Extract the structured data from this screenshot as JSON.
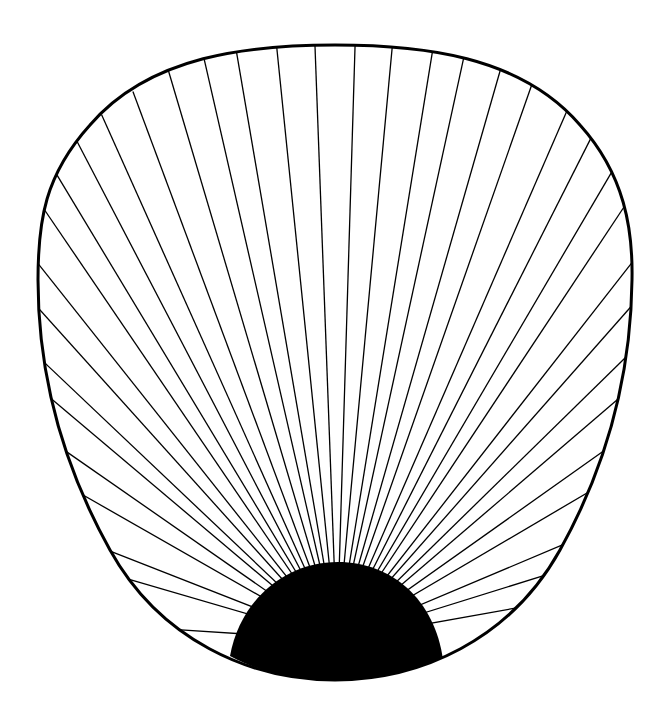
{
  "figure": {
    "background": "#ffffff",
    "stroke_color": "#000000",
    "hub_color": "#000000",
    "focus": [
      337,
      640
    ],
    "outline_path": "M 335 45 C 420 45, 520 55, 580 125 C 625 175, 633 230, 632 280 C 631 370, 610 460, 560 550 C 510 640, 420 680, 335 680 C 250 680, 160 640, 110 550 C 60 460, 38 370, 38 280 C 38 220, 45 175, 90 125 C 150 55, 250 45, 335 45 Z",
    "hub_path": "M 230 656 C 240 600, 285 562, 338 562 C 392 562, 435 600, 443 660 C 410 675, 370 680, 335 680 C 295 680, 260 672, 230 656 Z",
    "ray_endpoints": [
      [
        183,
        630
      ],
      [
        135,
        581
      ],
      [
        110,
        551
      ],
      [
        83,
        495
      ],
      [
        67,
        452
      ],
      [
        55,
        402
      ],
      [
        46,
        364
      ],
      [
        40,
        310
      ],
      [
        40,
        266
      ],
      [
        48,
        215
      ],
      [
        60,
        180
      ],
      [
        80,
        147
      ],
      [
        104,
        120
      ],
      [
        135,
        97
      ],
      [
        170,
        76
      ],
      [
        205,
        63
      ],
      [
        237,
        55
      ],
      [
        277,
        50
      ],
      [
        315,
        47
      ],
      [
        355,
        47
      ],
      [
        392,
        49
      ],
      [
        432,
        54
      ],
      [
        463,
        61
      ],
      [
        500,
        71
      ],
      [
        531,
        87
      ],
      [
        566,
        113
      ],
      [
        590,
        140
      ],
      [
        610,
        175
      ],
      [
        622,
        210
      ],
      [
        630,
        265
      ],
      [
        628,
        310
      ],
      [
        623,
        360
      ],
      [
        617,
        400
      ],
      [
        605,
        450
      ],
      [
        592,
        490
      ],
      [
        567,
        543
      ],
      [
        546,
        575
      ],
      [
        522,
        607
      ]
    ]
  }
}
